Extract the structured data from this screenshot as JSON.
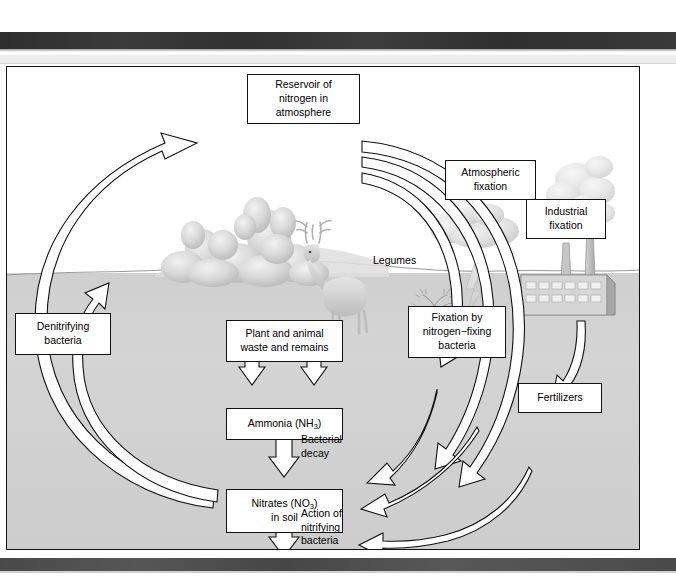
{
  "page": {
    "ghost_header_text": "",
    "figure_title": "The nitrogen cycle"
  },
  "diagram": {
    "type": "nitrogen-cycle",
    "boxes": [
      {
        "id": "reservoir",
        "label": "Reservoir of nitrogen in atmosphere",
        "lines": [
          "Reservoir of",
          "nitrogen in",
          "atmosphere"
        ]
      },
      {
        "id": "atmospheric-fixation",
        "label": "Atmospheric fixation",
        "lines": [
          "Atmospheric",
          "fixation"
        ]
      },
      {
        "id": "industrial-fixation",
        "label": "Industrial fixation",
        "lines": [
          "Industrial",
          "fixation"
        ]
      },
      {
        "id": "bacteria-fixation",
        "label": "Fixation by nitrogen−fixing bacteria",
        "lines": [
          "Fixation by",
          "nitrogen−fixing",
          "bacteria"
        ]
      },
      {
        "id": "denitrifying",
        "label": "Denitrifying bacteria",
        "lines": [
          "Denitrifying",
          "bacteria"
        ]
      },
      {
        "id": "waste",
        "label": "Plant and animal waste and remains",
        "lines": [
          "Plant and animal",
          "waste and remains"
        ]
      },
      {
        "id": "ammonia",
        "label": "Ammonia (NH3)",
        "lines": [
          "Ammonia (NH3)"
        ]
      },
      {
        "id": "nitrates",
        "label": "Nitrates (NO3) in soil",
        "lines": [
          "Nitrates (NO3)",
          "in soil"
        ]
      },
      {
        "id": "fertilizers",
        "label": "Fertilizers",
        "lines": [
          "Fertilizers"
        ]
      }
    ],
    "text": {
      "reservoir_l1": "Reservoir of",
      "reservoir_l2": "nitrogen in",
      "reservoir_l3": "atmosphere",
      "atmospheric_l1": "Atmospheric",
      "atmospheric_l2": "fixation",
      "industrial_l1": "Industrial",
      "industrial_l2": "fixation",
      "bacfix_l1": "Fixation by",
      "bacfix_l2": "nitrogen−fixing",
      "bacfix_l3": "bacteria",
      "denitrify_l1": "Denitrifying",
      "denitrify_l2": "bacteria",
      "waste_l1": "Plant and animal",
      "waste_l2": "waste and remains",
      "ammonia_pre": "Ammonia (NH",
      "ammonia_sub": "3",
      "ammonia_post": ")",
      "nitrates_pre": "Nitrates (NO",
      "nitrates_sub": "3",
      "nitrates_post": ")",
      "nitrates_l2": "in soil",
      "fertilizers": "Fertilizers"
    },
    "annotations": {
      "legumes": "Legumes",
      "bacterial_decay_l1": "Bacterial",
      "bacterial_decay_l2": "decay",
      "nitrifying_l1": "Action of",
      "nitrifying_l2": "nitrifying",
      "nitrifying_l3": "bacteria"
    },
    "scenery": [
      {
        "id": "trees",
        "name": "trees-bushes"
      },
      {
        "id": "deer",
        "name": "deer"
      },
      {
        "id": "cloud",
        "name": "storm-cloud"
      },
      {
        "id": "lightning",
        "name": "lightning-bolt"
      },
      {
        "id": "factory",
        "name": "factory"
      },
      {
        "id": "smoke",
        "name": "smoke-plume"
      },
      {
        "id": "legume-plant",
        "name": "legume-plant"
      }
    ],
    "flows": [
      {
        "from": "nitrates",
        "to": "reservoir",
        "via": "denitrifying"
      },
      {
        "from": "reservoir",
        "to": "atmospheric-fixation"
      },
      {
        "from": "reservoir",
        "to": "industrial-fixation"
      },
      {
        "from": "reservoir",
        "to": "bacteria-fixation"
      },
      {
        "from": "atmospheric-fixation",
        "to": "ammonia"
      },
      {
        "from": "bacteria-fixation",
        "to": "nitrates"
      },
      {
        "from": "industrial-fixation",
        "to": "nitrates",
        "via": "fertilizers"
      },
      {
        "from": "trees-deer",
        "to": "waste"
      },
      {
        "from": "waste",
        "to": "ammonia",
        "label": "Bacterial decay"
      },
      {
        "from": "ammonia",
        "to": "nitrates",
        "label": "Action of nitrifying bacteria"
      }
    ],
    "colors": {
      "ink": "#111111",
      "soil": "#d2d2d2",
      "sky": "#ffffff",
      "band": "#343434",
      "scenery": "#bdbdbd"
    }
  }
}
